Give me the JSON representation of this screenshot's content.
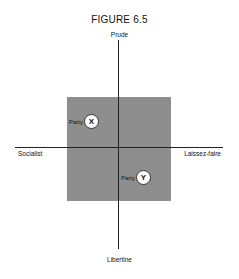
{
  "figure": {
    "title": "FIGURE 6.5",
    "axes": {
      "top": "Prude",
      "bottom": "Libertine",
      "left": "Socialist",
      "right": "Laissez-faire"
    },
    "colors": {
      "box": "#8a8a8a",
      "axis": "#222222",
      "marker_fill": "#ffffff"
    },
    "parties": [
      {
        "label": "Party",
        "marker": "X",
        "quadrant": "upper-left"
      },
      {
        "label": "Party",
        "marker": "Y",
        "quadrant": "lower-right"
      }
    ]
  }
}
